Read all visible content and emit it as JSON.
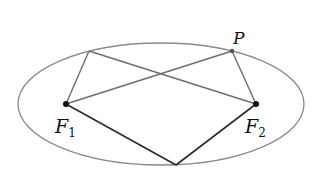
{
  "diagram": {
    "type": "ellipse-foci",
    "colors": {
      "ellipse": "#8a8a8a",
      "upper_lines": "#6e6e6e",
      "lower_lines": "#2a2a2a",
      "points": "#111111",
      "background": "#ffffff"
    },
    "ellipse": {
      "cx": 161,
      "cy": 104,
      "rx": 143,
      "ry": 61
    },
    "points": {
      "F1": {
        "x": 66,
        "y": 104
      },
      "F2": {
        "x": 256,
        "y": 104
      },
      "P": {
        "x": 232,
        "y": 51
      },
      "Q": {
        "x": 89,
        "y": 51
      },
      "R": {
        "x": 176,
        "y": 165
      }
    },
    "labels": {
      "P": {
        "main": "P",
        "sub": ""
      },
      "F1": {
        "main": "F",
        "sub": "1"
      },
      "F2": {
        "main": "F",
        "sub": "2"
      }
    }
  }
}
